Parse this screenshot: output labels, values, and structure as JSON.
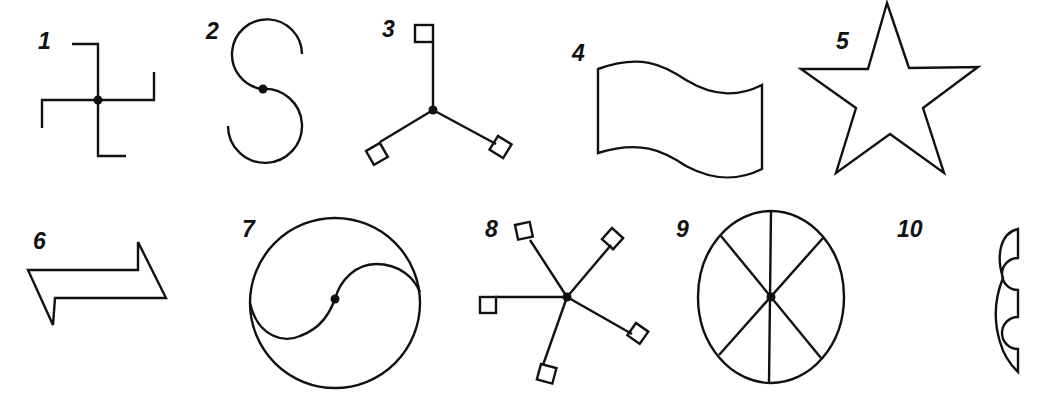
{
  "figure": {
    "background": "#ffffff",
    "stroke_color": "#111111",
    "symbols": [
      {
        "label": "1",
        "shape": "hooked cross with center dot"
      },
      {
        "label": "2",
        "shape": "S-curve with center dot"
      },
      {
        "label": "3",
        "shape": "three-armed radial with square ends"
      },
      {
        "label": "4",
        "shape": "waving flag outline"
      },
      {
        "label": "5",
        "shape": "five-pointed star outline"
      },
      {
        "label": "6",
        "shape": "double-headed offset arrow"
      },
      {
        "label": "7",
        "shape": "circle with S-curve divider (yin-yang style)"
      },
      {
        "label": "8",
        "shape": "five-armed radial with square ends"
      },
      {
        "label": "9",
        "shape": "circle divided into eight segments"
      },
      {
        "label": "10",
        "shape": "scalloped bracket outline"
      }
    ]
  }
}
